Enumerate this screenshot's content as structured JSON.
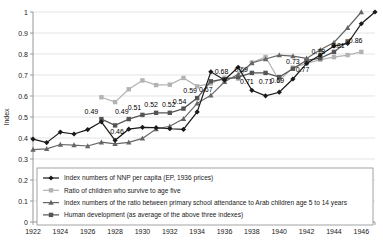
{
  "chart_data": {
    "type": "line",
    "title": "",
    "xlabel": "",
    "ylabel": "Index",
    "xlim": [
      1922,
      1947
    ],
    "ylim": [
      0,
      1
    ],
    "ytick_labels": [
      "0",
      "0.1",
      "0.2",
      "0.3",
      "0.4",
      "0.5",
      "0.6",
      "0.7",
      "0.8",
      "0.9",
      "1"
    ],
    "ytick_values": [
      0,
      0.1,
      0.2,
      0.3,
      0.4,
      0.5,
      0.6,
      0.7,
      0.8,
      0.9,
      1
    ],
    "xtick_labels": [
      "1922",
      "1924",
      "1926",
      "1928",
      "1930",
      "1932",
      "1934",
      "1936",
      "1938",
      "1940",
      "1942",
      "1944",
      "1946"
    ],
    "xtick_values": [
      1922,
      1924,
      1926,
      1928,
      1930,
      1932,
      1934,
      1936,
      1938,
      1940,
      1942,
      1944,
      1946
    ],
    "grid": "horizontal",
    "legend_position": "inside-lower-left",
    "x": [
      1922,
      1923,
      1924,
      1925,
      1926,
      1927,
      1928,
      1929,
      1930,
      1931,
      1932,
      1933,
      1934,
      1935,
      1936,
      1937,
      1938,
      1939,
      1940,
      1941,
      1942,
      1943,
      1944,
      1945,
      1946,
      1947
    ],
    "series": [
      {
        "name": "Index numbers of NNP per capita (EP, 1936 prices)",
        "marker": "diamond",
        "color": "#1a1a1a",
        "values": [
          0.395,
          0.378,
          0.428,
          0.419,
          0.44,
          0.477,
          0.389,
          0.442,
          0.451,
          0.449,
          0.444,
          0.441,
          0.524,
          0.715,
          0.676,
          0.737,
          0.627,
          0.601,
          0.618,
          0.681,
          0.755,
          0.795,
          0.838,
          0.85,
          0.944,
          1.0
        ]
      },
      {
        "name": "Ratio of children who survive to age five",
        "marker": "square",
        "color": "#b3b3b3",
        "values": [
          null,
          null,
          null,
          null,
          null,
          0.594,
          0.571,
          0.632,
          0.674,
          0.652,
          0.654,
          0.686,
          0.646,
          0.66,
          0.687,
          0.683,
          0.759,
          0.786,
          0.674,
          0.735,
          0.755,
          0.773,
          0.785,
          0.795,
          0.81,
          null
        ]
      },
      {
        "name": "Index numbers of the ratio between primary school attendance to Arab children age 5 to 14 years",
        "marker": "triangle",
        "color": "#666666",
        "values": [
          0.345,
          0.348,
          0.369,
          0.366,
          0.362,
          0.38,
          0.372,
          0.379,
          0.398,
          0.443,
          0.456,
          0.491,
          0.565,
          0.603,
          0.668,
          0.703,
          0.757,
          0.776,
          0.795,
          0.79,
          0.779,
          0.82,
          0.855,
          0.925,
          1.0,
          null
        ]
      },
      {
        "name": "Human development (as average of the above three indexes)",
        "marker": "square",
        "color": "#555555",
        "values": [
          null,
          null,
          null,
          null,
          null,
          0.49,
          0.46,
          0.49,
          0.51,
          0.52,
          0.52,
          0.54,
          0.59,
          0.67,
          0.68,
          0.69,
          0.71,
          0.71,
          0.69,
          0.73,
          0.77,
          0.78,
          0.81,
          0.86,
          null,
          null
        ]
      }
    ],
    "data_labels": [
      {
        "text": "0.49",
        "x": 1927,
        "y": 0.49,
        "dx": -10,
        "dy": -5
      },
      {
        "text": "0.46",
        "x": 1928,
        "y": 0.46,
        "dx": 2,
        "dy": 9
      },
      {
        "text": "0.49",
        "x": 1929,
        "y": 0.49,
        "dx": -7,
        "dy": -5
      },
      {
        "text": "0.51",
        "x": 1930,
        "y": 0.51,
        "dx": -8,
        "dy": -5
      },
      {
        "text": "0.52",
        "x": 1931,
        "y": 0.52,
        "dx": -5,
        "dy": -6
      },
      {
        "text": "0.52",
        "x": 1932,
        "y": 0.52,
        "dx": -1,
        "dy": -6
      },
      {
        "text": "0.54",
        "x": 1933,
        "y": 0.54,
        "dx": -4,
        "dy": -5
      },
      {
        "text": "0.59",
        "x": 1934,
        "y": 0.59,
        "dx": -7,
        "dy": -5
      },
      {
        "text": "0.67",
        "x": 1935,
        "y": 0.67,
        "dx": -5,
        "dy": 11
      },
      {
        "text": "0.68",
        "x": 1936,
        "y": 0.68,
        "dx": -3,
        "dy": -5
      },
      {
        "text": "0.69",
        "x": 1937,
        "y": 0.69,
        "dx": 3,
        "dy": -5
      },
      {
        "text": "0.71",
        "x": 1938,
        "y": 0.71,
        "dx": -5,
        "dy": 11
      },
      {
        "text": "0.71",
        "x": 1939,
        "y": 0.71,
        "dx": 0,
        "dy": 11
      },
      {
        "text": "0.69",
        "x": 1940,
        "y": 0.69,
        "dx": -2,
        "dy": 6
      },
      {
        "text": "0.73",
        "x": 1941,
        "y": 0.73,
        "dx": 0,
        "dy": -5
      },
      {
        "text": "0.77",
        "x": 1942,
        "y": 0.77,
        "dx": -4,
        "dy": 12
      },
      {
        "text": "0.78",
        "x": 1943,
        "y": 0.78,
        "dx": -2,
        "dy": -4
      },
      {
        "text": "0.81",
        "x": 1944,
        "y": 0.81,
        "dx": 4,
        "dy": -4
      },
      {
        "text": "0.86",
        "x": 1945,
        "y": 0.86,
        "dx": 8,
        "dy": 2
      }
    ],
    "legend": [
      {
        "label": "Index numbers of NNP per capita (EP, 1936 prices)",
        "marker": "diamond",
        "color": "#1a1a1a"
      },
      {
        "label": "Ratio of children who survive to age five",
        "marker": "square",
        "color": "#b3b3b3"
      },
      {
        "label": "Index numbers of the ratio between primary school attendance to Arab children age 5 to 14 years",
        "marker": "triangle",
        "color": "#666666"
      },
      {
        "label": "Human development (as average of the above three indexes)",
        "marker": "square",
        "color": "#555555"
      }
    ]
  }
}
